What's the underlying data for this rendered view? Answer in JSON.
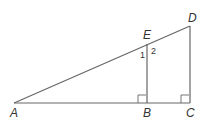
{
  "diagram": {
    "points": {
      "A": {
        "label": "A",
        "x": 14,
        "y": 103
      },
      "B": {
        "label": "B",
        "x": 147,
        "y": 103
      },
      "C": {
        "label": "C",
        "x": 190,
        "y": 103
      },
      "D": {
        "label": "D",
        "x": 190,
        "y": 26
      },
      "E": {
        "label": "E",
        "x": 147,
        "y": 44
      }
    },
    "angle_labels": {
      "one": "1",
      "two": "2"
    },
    "segments": [
      "AD",
      "AC",
      "EB",
      "DC"
    ],
    "right_angles": [
      "B",
      "C"
    ]
  }
}
